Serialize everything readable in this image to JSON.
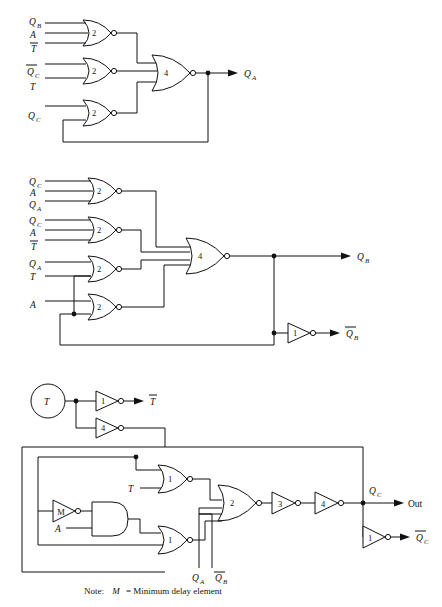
{
  "figure": {
    "note_prefix": "Note:",
    "note_symbol": "M",
    "note_text": "= Minimum delay element",
    "background": "#ffffff",
    "ink": "#111111"
  },
  "blocks": [
    {
      "id": "block-qa",
      "output_label": "QA",
      "gates": [
        {
          "name": "nor-2-qa-1",
          "num": "2",
          "type": "nor",
          "inputs": [
            "QB",
            "A",
            "Tbar"
          ]
        },
        {
          "name": "nor-2-qa-2",
          "num": "2",
          "type": "nor",
          "inputs": [
            "QCbar",
            "T"
          ]
        },
        {
          "name": "nor-2-qa-3",
          "num": "2",
          "type": "nor",
          "inputs": [
            "QC",
            "QA-feedback"
          ]
        },
        {
          "name": "nor-4-qa",
          "num": "4",
          "type": "nor",
          "inputs": [
            "nor-2-qa-1",
            "nor-2-qa-2",
            "nor-2-qa-3"
          ]
        }
      ]
    },
    {
      "id": "block-qb",
      "output_label": "QB",
      "inverted_output_label": "QB-bar",
      "gates": [
        {
          "name": "nor-2-qb-1",
          "num": "2",
          "type": "nor",
          "inputs": [
            "QC",
            "A",
            "QA"
          ]
        },
        {
          "name": "nor-2-qb-2",
          "num": "2",
          "type": "nor",
          "inputs": [
            "QC",
            "A",
            "Tbar"
          ]
        },
        {
          "name": "nor-2-qb-3",
          "num": "2",
          "type": "nor",
          "inputs": [
            "QA",
            "T"
          ]
        },
        {
          "name": "nor-2-qb-4",
          "num": "2",
          "type": "nor",
          "inputs": [
            "A",
            "QB-bar-feedback"
          ]
        },
        {
          "name": "nor-4-qb",
          "num": "4",
          "type": "nor",
          "inputs": [
            "nor-2-qb-1",
            "nor-2-qb-2",
            "nor-2-qb-3",
            "nor-2-qb-4"
          ]
        },
        {
          "name": "inv-1-qb",
          "num": "1",
          "type": "inverter",
          "inputs": [
            "QB"
          ]
        }
      ]
    },
    {
      "id": "block-qc",
      "output_label": "QC",
      "inverted_output_label": "QC-bar",
      "out_label": "Out",
      "gates": [
        {
          "name": "inv-1-t",
          "num": "1",
          "type": "inverter",
          "inputs": [
            "T"
          ]
        },
        {
          "name": "inv-4-t",
          "num": "4",
          "type": "inverter",
          "inputs": [
            "T"
          ]
        },
        {
          "name": "nor-1-qc-top",
          "num": "1",
          "type": "nor",
          "inputs": [
            "feedback-top",
            "T"
          ]
        },
        {
          "name": "inv-m",
          "num": "M",
          "type": "inverter",
          "inputs": [
            "feedback-loop"
          ]
        },
        {
          "name": "and-ma",
          "num": "",
          "type": "and",
          "inputs": [
            "inv-m",
            "A"
          ]
        },
        {
          "name": "nor-1-qc-bot",
          "num": "1",
          "type": "nor",
          "inputs": [
            "and-ma",
            "feedback-bottom"
          ]
        },
        {
          "name": "nor-2-qc",
          "num": "2",
          "type": "nor",
          "inputs": [
            "nor-1-qc-top",
            "QA",
            "QB-bar",
            "nor-1-qc-bot"
          ]
        },
        {
          "name": "inv-3-qc",
          "num": "3",
          "type": "inverter",
          "inputs": [
            "nor-2-qc"
          ]
        },
        {
          "name": "inv-4-qc",
          "num": "4",
          "type": "inverter",
          "inputs": [
            "inv-3-qc"
          ]
        },
        {
          "name": "inv-1-qc",
          "num": "1",
          "type": "inverter",
          "inputs": [
            "QC"
          ]
        }
      ]
    }
  ],
  "labels": {
    "Q": "Q",
    "A": "A",
    "T": "T",
    "M": "M",
    "Out": "Out",
    "sub_A": "A",
    "sub_B": "B",
    "sub_C": "C"
  },
  "gate_numbers": {
    "b1": [
      "2",
      "2",
      "2",
      "4"
    ],
    "b2": [
      "2",
      "2",
      "2",
      "2",
      "4",
      "1"
    ],
    "b3": [
      "1",
      "4",
      "1",
      "M",
      "1",
      "2",
      "3",
      "4",
      "1"
    ]
  },
  "signals": {
    "qa": "QA",
    "qb": "QB",
    "qc": "QC",
    "qa_bar": "QA-bar",
    "qb_bar": "QB-bar",
    "qc_bar": "QC-bar",
    "t": "T",
    "t_bar": "T-bar",
    "a": "A",
    "out": "Out"
  }
}
